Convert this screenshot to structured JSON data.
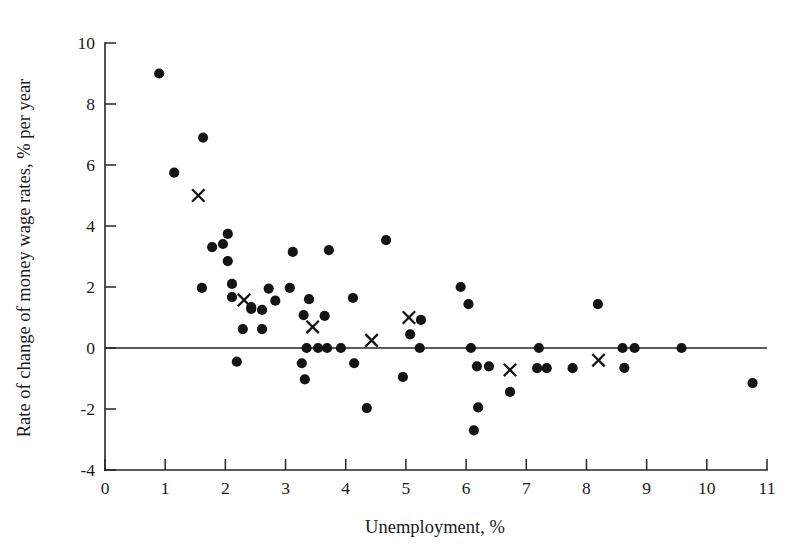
{
  "chart_data": {
    "type": "scatter",
    "title": "",
    "xlabel": "Unemployment, %",
    "ylabel": "Rate of change of money wage rates, % per year",
    "xlim": [
      0,
      11
    ],
    "ylim": [
      -4,
      10
    ],
    "xticks": [
      0,
      1,
      2,
      3,
      4,
      5,
      6,
      7,
      8,
      9,
      10,
      11
    ],
    "yticks": [
      -4,
      -2,
      0,
      2,
      4,
      6,
      8,
      10
    ],
    "xtick_labels": [
      "0",
      "1",
      "2",
      "3",
      "4",
      "5",
      "6",
      "7",
      "8",
      "9",
      "10",
      "11"
    ],
    "ytick_labels": [
      "-4",
      "-2",
      "0",
      "2",
      "4",
      "6",
      "8",
      "10"
    ],
    "grid": false,
    "legend": false,
    "zero_line": true,
    "series": [
      {
        "name": "observations",
        "marker": "circle",
        "color": "#141414",
        "points": [
          [
            0.9,
            9.0
          ],
          [
            1.15,
            5.75
          ],
          [
            1.63,
            6.9
          ],
          [
            1.61,
            1.97
          ],
          [
            1.78,
            3.31
          ],
          [
            1.96,
            3.41
          ],
          [
            2.04,
            3.74
          ],
          [
            2.04,
            2.85
          ],
          [
            2.11,
            2.1
          ],
          [
            2.11,
            1.67
          ],
          [
            2.19,
            -0.45
          ],
          [
            2.29,
            0.62
          ],
          [
            2.43,
            1.28
          ],
          [
            2.43,
            1.34
          ],
          [
            2.61,
            1.25
          ],
          [
            2.61,
            0.62
          ],
          [
            2.72,
            1.95
          ],
          [
            2.83,
            1.55
          ],
          [
            3.07,
            1.97
          ],
          [
            3.12,
            3.15
          ],
          [
            3.27,
            -0.5
          ],
          [
            3.3,
            1.08
          ],
          [
            3.32,
            -1.03
          ],
          [
            3.35,
            0.0
          ],
          [
            3.39,
            1.6
          ],
          [
            3.54,
            0.0
          ],
          [
            3.65,
            1.05
          ],
          [
            3.69,
            0.0
          ],
          [
            3.72,
            3.21
          ],
          [
            3.92,
            0.0
          ],
          [
            4.12,
            1.64
          ],
          [
            4.14,
            -0.5
          ],
          [
            4.35,
            -1.97
          ],
          [
            4.67,
            3.54
          ],
          [
            4.95,
            -0.95
          ],
          [
            5.07,
            0.45
          ],
          [
            5.23,
            0.0
          ],
          [
            5.25,
            0.92
          ],
          [
            5.91,
            2.0
          ],
          [
            6.04,
            1.44
          ],
          [
            6.08,
            0.0
          ],
          [
            6.13,
            -2.7
          ],
          [
            6.18,
            -0.6
          ],
          [
            6.2,
            -1.95
          ],
          [
            6.38,
            -0.6
          ],
          [
            6.73,
            -1.44
          ],
          [
            7.18,
            -0.66
          ],
          [
            7.21,
            0.0
          ],
          [
            7.34,
            -0.66
          ],
          [
            7.77,
            -0.66
          ],
          [
            8.19,
            1.44
          ],
          [
            8.6,
            0.0
          ],
          [
            8.63,
            -0.65
          ],
          [
            8.8,
            0.0
          ],
          [
            9.58,
            0.0
          ],
          [
            10.76,
            -1.15
          ]
        ]
      },
      {
        "name": "cross-markers",
        "marker": "cross",
        "color": "#141414",
        "points": [
          [
            1.55,
            5.0
          ],
          [
            2.31,
            1.57
          ],
          [
            3.45,
            0.69
          ],
          [
            4.43,
            0.25
          ],
          [
            5.05,
            1.0
          ],
          [
            6.73,
            -0.72
          ],
          [
            8.2,
            -0.4
          ]
        ]
      }
    ]
  },
  "axes": {
    "x_title": "Unemployment, %",
    "y_title": "Rate of change of money wage rates, % per year"
  }
}
